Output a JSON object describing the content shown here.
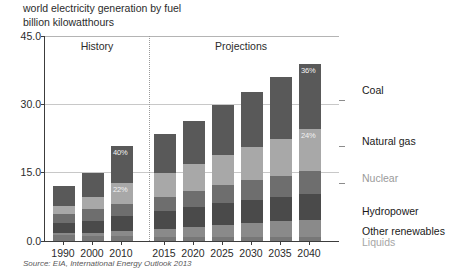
{
  "titles": {
    "line1": "world electricity generation by fuel",
    "line2": "billion kilowatthours"
  },
  "source": "Source: EIA, International Energy Outlook 2013",
  "periods": {
    "history_label": "History",
    "projections_label": "Projections"
  },
  "legend": {
    "coal": "Coal",
    "natural_gas": "Natural gas",
    "nuclear": "Nuclear",
    "hydropower": "Hydropower",
    "other_renewables": "Other renewables",
    "liquids": "Liquids"
  },
  "annotations": {
    "coal_2010": "40%",
    "gas_2010": "22%",
    "coal_2040": "36%",
    "gas_2040": "24%"
  },
  "colors": {
    "coal": "#595959",
    "natural_gas": "#a8a8a8",
    "nuclear": "#6e6e6e",
    "hydropower": "#4a4a4a",
    "other_renewables": "#8a8a8a",
    "liquids": "#777777",
    "axis": "#3c3c3c",
    "grid": "#c8c8c8",
    "text": "#2b2b2b",
    "muted_text": "#8c8c8c"
  },
  "chart_data": {
    "type": "bar",
    "title": "world electricity generation by fuel",
    "subtitle": "billion kilowatthours",
    "xlabel": "",
    "ylabel": "billion kilowatthours",
    "ylim": [
      0,
      45
    ],
    "yticks": [
      "0.0",
      "15.0",
      "30.0",
      "45.0"
    ],
    "ytick_values": [
      0,
      15,
      30,
      45
    ],
    "grid": true,
    "legend_position": "right",
    "stacked": true,
    "categories": [
      "1990",
      "2000",
      "2010",
      "2015",
      "2020",
      "2025",
      "2030",
      "2035",
      "2040"
    ],
    "series": [
      {
        "name": "Liquids",
        "values": [
          1.3,
          1.2,
          1.0,
          0.9,
          0.9,
          0.9,
          0.9,
          0.9,
          0.9
        ]
      },
      {
        "name": "Other renewables",
        "values": [
          0.4,
          0.6,
          1.1,
          1.7,
          2.2,
          2.6,
          3.0,
          3.4,
          3.8
        ]
      },
      {
        "name": "Hydropower",
        "values": [
          2.2,
          2.7,
          3.5,
          4.0,
          4.4,
          4.8,
          5.1,
          5.4,
          5.7
        ]
      },
      {
        "name": "Nuclear",
        "values": [
          2.0,
          2.5,
          2.6,
          3.0,
          3.5,
          3.9,
          4.3,
          4.6,
          4.9
        ]
      },
      {
        "name": "Natural gas",
        "values": [
          1.7,
          2.7,
          4.6,
          5.4,
          6.0,
          6.7,
          7.4,
          8.2,
          9.4
        ]
      },
      {
        "name": "Coal",
        "values": [
          4.4,
          5.3,
          8.1,
          8.6,
          9.3,
          10.9,
          12.1,
          13.6,
          14.1
        ]
      }
    ],
    "totals": [
      12.0,
      15.0,
      20.9,
      23.6,
      26.3,
      29.8,
      32.8,
      36.1,
      38.8
    ],
    "data_labels": [
      {
        "category": "2010",
        "series": "Coal",
        "text": "40%"
      },
      {
        "category": "2010",
        "series": "Natural gas",
        "text": "22%"
      },
      {
        "category": "2040",
        "series": "Coal",
        "text": "36%"
      },
      {
        "category": "2040",
        "series": "Natural gas",
        "text": "24%"
      }
    ],
    "annotations": [
      {
        "text": "History",
        "region": "1990-2010"
      },
      {
        "text": "Projections",
        "region": "2015-2040"
      }
    ]
  }
}
